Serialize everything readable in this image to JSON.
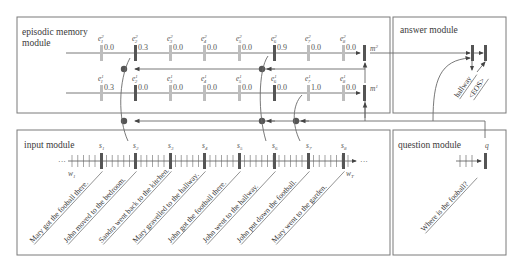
{
  "modules": {
    "episodic": {
      "title_line1": "episodic memory",
      "title_line2": "module"
    },
    "answer": {
      "title": "answer module"
    },
    "input": {
      "title": "input module"
    },
    "question": {
      "title": "question module"
    }
  },
  "memory": {
    "pass2": {
      "label": "e",
      "superscript": "2",
      "memory_label": "m",
      "memory_sup": "2",
      "gates": [
        {
          "sub": "1",
          "value": "0.0",
          "active": false
        },
        {
          "sub": "2",
          "value": "0.3",
          "active": true
        },
        {
          "sub": "3",
          "value": "0.0",
          "active": false
        },
        {
          "sub": "4",
          "value": "0.0",
          "active": false
        },
        {
          "sub": "5",
          "value": "0.0",
          "active": false
        },
        {
          "sub": "6",
          "value": "0.9",
          "active": true
        },
        {
          "sub": "7",
          "value": "0.0",
          "active": false
        },
        {
          "sub": "8",
          "value": "0.0",
          "active": false
        }
      ]
    },
    "pass1": {
      "label": "e",
      "superscript": "1",
      "memory_label": "m",
      "memory_sup": "1",
      "gates": [
        {
          "sub": "1",
          "value": "0.3",
          "active": false
        },
        {
          "sub": "2",
          "value": "0.0",
          "active": true
        },
        {
          "sub": "3",
          "value": "0.0",
          "active": false
        },
        {
          "sub": "4",
          "value": "0.0",
          "active": false
        },
        {
          "sub": "5",
          "value": "0.0",
          "active": false
        },
        {
          "sub": "6",
          "value": "0.0",
          "active": true
        },
        {
          "sub": "7",
          "value": "1.0",
          "active": false
        },
        {
          "sub": "8",
          "value": "0.0",
          "active": false
        }
      ]
    }
  },
  "input": {
    "facts": [
      {
        "label": "s",
        "sub": "1"
      },
      {
        "label": "s",
        "sub": "2"
      },
      {
        "label": "s",
        "sub": "3"
      },
      {
        "label": "s",
        "sub": "4"
      },
      {
        "label": "s",
        "sub": "5"
      },
      {
        "label": "s",
        "sub": "6"
      },
      {
        "label": "s",
        "sub": "7"
      },
      {
        "label": "s",
        "sub": "8"
      }
    ],
    "w_first": "w",
    "w_first_sub": "1",
    "w_last": "w",
    "w_last_sub": "T",
    "ellipsis": "···",
    "sentences": [
      "Mary got the fooball there.",
      "John moved to the bedroom.",
      "Sandra went back to the kitchen.",
      "Mary gravelled to the hallway.",
      "John got the football there.",
      "John went to the hallway.",
      "John put down the football.",
      "Mary went to the garden."
    ]
  },
  "question": {
    "label": "q",
    "text": "Where is the fooball?"
  },
  "answer": {
    "tokens": [
      "hallway",
      "<EOS>"
    ]
  },
  "colors": {
    "active_bar": "#555555",
    "inactive_bar": "#bdbdbd",
    "node": "#555555",
    "line": "#6a6a6a"
  }
}
